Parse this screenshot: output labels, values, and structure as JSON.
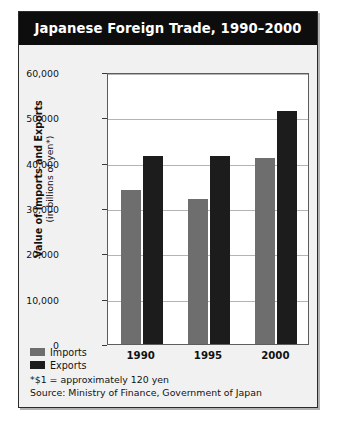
{
  "figure": {
    "title": "Japanese Foreign Trade, 1990–2000"
  },
  "legend": {
    "items": [
      {
        "label": "Imports",
        "color": "#6e6e6e",
        "swatch": "legend-swatch-imports"
      },
      {
        "label": "Exports",
        "color": "#1c1c1c",
        "swatch": "legend-swatch-exports"
      }
    ]
  },
  "notes": [
    "*$1 = approximately 120 yen",
    "Source: Ministry of Finance, Government of Japan"
  ],
  "chart_data": {
    "type": "bar",
    "title": "Japanese Foreign Trade, 1990–2000",
    "xlabel": "",
    "ylabel": "Value of Imports and Exports",
    "ylabel_line1": "Value of Imports and Exports",
    "ylabel_line2": "(in billions of yen*)",
    "categories": [
      "1990",
      "1995",
      "2000"
    ],
    "series": [
      {
        "name": "Imports",
        "color": "#6e6e6e",
        "values": [
          34000,
          32000,
          41000
        ]
      },
      {
        "name": "Exports",
        "color": "#1c1c1c",
        "values": [
          41500,
          41500,
          51500
        ]
      }
    ],
    "ylim": [
      0,
      60000
    ],
    "yticks": [
      0,
      10000,
      20000,
      30000,
      40000,
      50000,
      60000
    ],
    "ytick_labels": [
      "0",
      "10,000",
      "20,000",
      "30,000",
      "40,000",
      "50,000",
      "60,000"
    ],
    "grid": true,
    "legend_position": "bottom-left",
    "units": "billions of yen",
    "annotations": [
      "*$1 = approximately 120 yen",
      "Source: Ministry of Finance, Government of Japan"
    ]
  }
}
